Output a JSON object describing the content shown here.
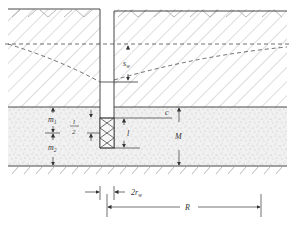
{
  "diagram": {
    "type": "well-drawdown-cross-section",
    "labels": {
      "drawdown": "s",
      "drawdown_sub": "w",
      "c": "c",
      "m1": "m",
      "m1_sub": "1",
      "m2": "m",
      "m2_sub": "2",
      "half_l_num": "l",
      "half_l_den": "2",
      "l": "l",
      "M": "M",
      "two_rw": "2r",
      "two_rw_sub": "w",
      "R": "R"
    },
    "colors": {
      "line": "#333333",
      "hatch": "#9a9a9a",
      "sand": "#f2f2f2",
      "dots": "#8a8a8a"
    }
  }
}
